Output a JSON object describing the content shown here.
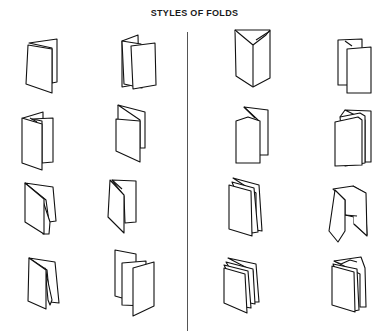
{
  "title": "STYLES OF FOLDS",
  "layout": {
    "rows": 4,
    "columns": 4,
    "divider_between_columns": [
      2,
      3
    ]
  },
  "folds": [
    {
      "row": 1,
      "col": 1,
      "description": "single fold (4-page folder)"
    },
    {
      "row": 1,
      "col": 2,
      "description": "accordion fold, 3 panels"
    },
    {
      "row": 1,
      "col": 3,
      "description": "letter fold with angled top, 3 panels"
    },
    {
      "row": 1,
      "col": 4,
      "description": "accordion fold, 3 panels (narrow)"
    },
    {
      "row": 2,
      "col": 1,
      "description": "accordion fold, 4 panels"
    },
    {
      "row": 2,
      "col": 2,
      "description": "single fold with short back panel"
    },
    {
      "row": 2,
      "col": 3,
      "description": "accordion fold with tall back panel"
    },
    {
      "row": 2,
      "col": 4,
      "description": "accordion fold, 4 panels stacked"
    },
    {
      "row": 3,
      "col": 1,
      "description": "double parallel fold"
    },
    {
      "row": 3,
      "col": 2,
      "description": "letter fold"
    },
    {
      "row": 3,
      "col": 3,
      "description": "double parallel fold, tall"
    },
    {
      "row": 3,
      "col": 4,
      "description": "gate fold"
    },
    {
      "row": 4,
      "col": 1,
      "description": "french fold variant"
    },
    {
      "row": 4,
      "col": 2,
      "description": "accordion fold, 4 panels offset"
    },
    {
      "row": 4,
      "col": 3,
      "description": "multi-page signature fold"
    },
    {
      "row": 4,
      "col": 4,
      "description": "multi-page signature fold, angled"
    }
  ]
}
